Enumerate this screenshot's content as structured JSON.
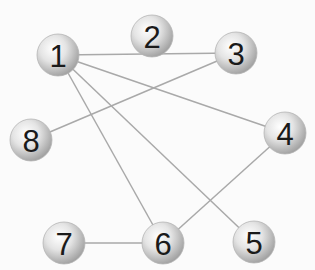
{
  "graph": {
    "nodes": [
      {
        "id": "1",
        "label": "1",
        "x": 58,
        "y": 55
      },
      {
        "id": "2",
        "label": "2",
        "x": 152,
        "y": 36
      },
      {
        "id": "3",
        "label": "3",
        "x": 236,
        "y": 53
      },
      {
        "id": "4",
        "label": "4",
        "x": 285,
        "y": 133
      },
      {
        "id": "5",
        "label": "5",
        "x": 254,
        "y": 242
      },
      {
        "id": "6",
        "label": "6",
        "x": 163,
        "y": 243
      },
      {
        "id": "7",
        "label": "7",
        "x": 64,
        "y": 243
      },
      {
        "id": "8",
        "label": "8",
        "x": 31,
        "y": 140
      }
    ],
    "edges": [
      {
        "from": "1",
        "to": "3"
      },
      {
        "from": "1",
        "to": "4"
      },
      {
        "from": "1",
        "to": "5"
      },
      {
        "from": "1",
        "to": "6"
      },
      {
        "from": "8",
        "to": "3"
      },
      {
        "from": "4",
        "to": "6"
      },
      {
        "from": "7",
        "to": "6"
      }
    ],
    "node_radius": 21,
    "colors": {
      "edge": "#a9a9a9",
      "node_fill_light": "#fafafa",
      "node_fill_dark": "#a8a8a8",
      "label": "#1a1a1a",
      "background": "#fbfbfb"
    }
  }
}
